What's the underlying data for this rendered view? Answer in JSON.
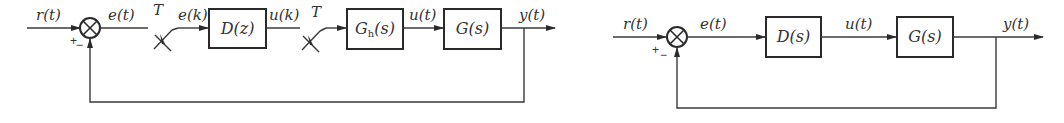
{
  "diagrams": [
    {
      "name": "digital-control-system",
      "signals": {
        "input": "r(t)",
        "error": "e(t)",
        "sampled_error": "e(k)",
        "controller_output": "u(k)",
        "plant_input": "u(t)",
        "output": "y(t)"
      },
      "samplers": [
        "T",
        "T"
      ],
      "blocks": {
        "controller": "D(z)",
        "hold_main": "G",
        "hold_sub": "h",
        "hold_arg": "(s)",
        "plant": "G(s)"
      },
      "summer_signs": {
        "plus": "+",
        "minus": "−"
      }
    },
    {
      "name": "continuous-control-system",
      "signals": {
        "input": "r(t)",
        "error": "e(t)",
        "control": "u(t)",
        "output": "y(t)"
      },
      "blocks": {
        "controller": "D(s)",
        "plant": "G(s)"
      },
      "summer_signs": {
        "plus": "+",
        "minus": "−"
      }
    }
  ],
  "colors": {
    "line": "#3a3a3a",
    "background": "#ffffff"
  }
}
